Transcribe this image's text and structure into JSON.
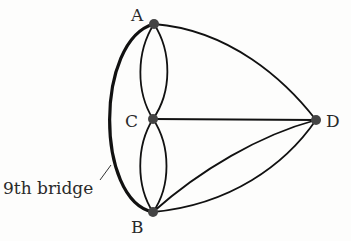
{
  "diagram": {
    "type": "graph",
    "nodes": [
      {
        "id": "A",
        "label": "A",
        "x": 154,
        "y": 24
      },
      {
        "id": "C",
        "label": "C",
        "x": 153,
        "y": 119
      },
      {
        "id": "B",
        "label": "B",
        "x": 153,
        "y": 212
      },
      {
        "id": "D",
        "label": "D",
        "x": 316,
        "y": 120
      }
    ],
    "edges": [
      {
        "from": "A",
        "to": "C",
        "kind": "arc-left"
      },
      {
        "from": "A",
        "to": "C",
        "kind": "arc-right"
      },
      {
        "from": "C",
        "to": "B",
        "kind": "arc-left"
      },
      {
        "from": "C",
        "to": "B",
        "kind": "arc-right"
      },
      {
        "from": "A",
        "to": "D",
        "kind": "curve"
      },
      {
        "from": "C",
        "to": "D",
        "kind": "straight"
      },
      {
        "from": "B",
        "to": "D",
        "kind": "curve-upper"
      },
      {
        "from": "B",
        "to": "D",
        "kind": "curve-lower"
      },
      {
        "from": "A",
        "to": "B",
        "kind": "thick-outer-arc",
        "label": "9th bridge"
      }
    ],
    "annotation": {
      "text": "9th bridge"
    },
    "colors": {
      "edge": "#111111",
      "node": "#444444",
      "text": "#2a2a2a",
      "background": "#fdfdfc"
    }
  }
}
